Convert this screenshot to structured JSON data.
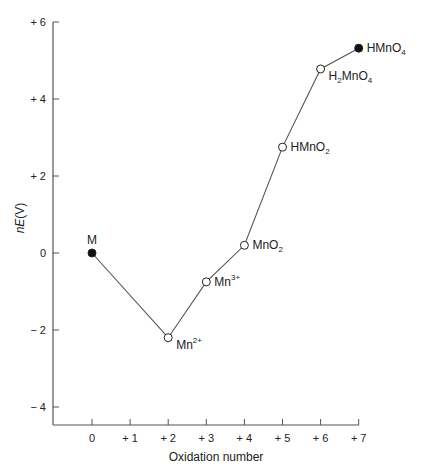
{
  "chart_data": {
    "type": "line",
    "title": "",
    "xlabel": "Oxidation number",
    "ylabel": "nE(V)",
    "ylabel_parts": {
      "italic": "nE",
      "rest": "(V)"
    },
    "xlim": [
      -1,
      7
    ],
    "ylim": [
      -4.5,
      6
    ],
    "grid": false,
    "legend": null,
    "x_ticks": [
      0,
      1,
      2,
      3,
      4,
      5,
      6,
      7
    ],
    "x_tick_labels": [
      "0",
      "+ 1",
      "+ 2",
      "+ 3",
      "+ 4",
      "+ 5",
      "+ 6",
      "+ 7"
    ],
    "y_ticks": [
      6,
      4,
      2,
      0,
      -2,
      -4
    ],
    "y_tick_labels": [
      "+ 6",
      "+ 4",
      "+ 2",
      "0",
      "− 2",
      "− 4"
    ],
    "series": [
      {
        "name": "Mn species",
        "points": [
          {
            "x": 0,
            "y": 0.0,
            "label": "M",
            "label_main": "M",
            "label_sub": "",
            "label_sup": "",
            "label_after": "",
            "marker": "filled",
            "label_pos": "above"
          },
          {
            "x": 2,
            "y": -2.2,
            "label": "Mn2+",
            "label_main": "Mn",
            "label_sub": "",
            "label_sup": "2+",
            "label_after": "",
            "marker": "open",
            "label_pos": "right-below"
          },
          {
            "x": 3,
            "y": -0.75,
            "label": "Mn3+",
            "label_main": "Mn",
            "label_sub": "",
            "label_sup": "3+",
            "label_after": "",
            "marker": "open",
            "label_pos": "right"
          },
          {
            "x": 4,
            "y": 0.2,
            "label": "MnO2",
            "label_main": "MnO",
            "label_sub": "2",
            "label_sup": "",
            "label_after": "",
            "marker": "open",
            "label_pos": "right"
          },
          {
            "x": 5,
            "y": 2.75,
            "label": "HMnO2",
            "label_main": "HMnO",
            "label_sub": "2",
            "label_sup": "",
            "label_after": "",
            "marker": "open",
            "label_pos": "right"
          },
          {
            "x": 6,
            "y": 4.78,
            "label": "H2MnO4",
            "label_main": "H",
            "label_sub": "2",
            "label_sup": "",
            "label_after": "MnO",
            "label_sub2": "4",
            "marker": "open",
            "label_pos": "right-below"
          },
          {
            "x": 7,
            "y": 5.32,
            "label": "HMnO4",
            "label_main": "HMnO",
            "label_sub": "4",
            "label_sup": "",
            "label_after": "",
            "marker": "filled",
            "label_pos": "right"
          }
        ]
      }
    ]
  },
  "colors": {
    "axis": "#555555",
    "line": "#555555",
    "marker_fill_filled": "#111111",
    "marker_fill_open": "#ffffff",
    "marker_stroke": "#222222",
    "text": "#222222"
  }
}
